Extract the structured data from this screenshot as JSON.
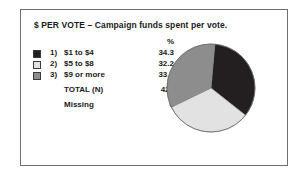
{
  "chart_data": {
    "type": "pie",
    "title": "$ PER VOTE – Campaign funds spent per vote.",
    "value_header": "%",
    "categories": [
      "$1 to $4",
      "$5 to $8",
      "$9 or more"
    ],
    "values": [
      34.3,
      32.2,
      33.6
    ],
    "value_labels": [
      "34.3",
      "32.2",
      "33.6"
    ],
    "item_numbers": [
      "1)",
      "2)",
      "3)"
    ],
    "colors": [
      "#231f20",
      "#e2e2e2",
      "#8d8d8d"
    ],
    "legend_position": "left",
    "grid": false,
    "total_label": "TOTAL  (N)",
    "total_value": "429",
    "missing_label": "Missing",
    "missing_value": "6",
    "start_angle_deg": 5,
    "frame_color": "#6e6e6e"
  }
}
